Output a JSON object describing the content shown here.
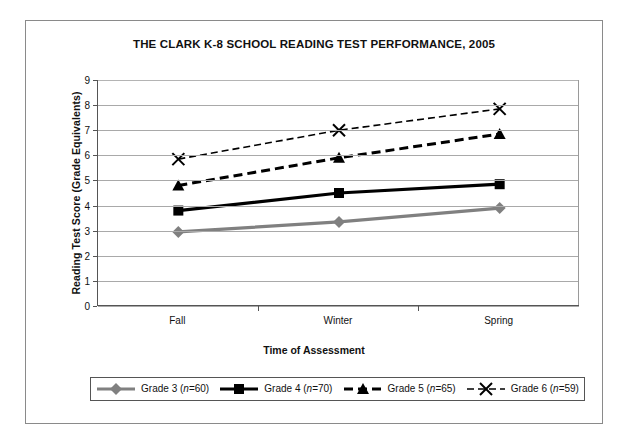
{
  "chart_data": {
    "type": "line",
    "title": "THE CLARK K-8 SCHOOL READING TEST PERFORMANCE, 2005",
    "xlabel": "Time of Assessment",
    "ylabel": "Reading Test Score (Grade Equivalents)",
    "categories": [
      "Fall",
      "Winter",
      "Spring"
    ],
    "ylim": [
      0,
      9
    ],
    "yticks": [
      0,
      1,
      2,
      3,
      4,
      5,
      6,
      7,
      8,
      9
    ],
    "ytick_labels": [
      "0",
      "1",
      "2",
      "3",
      "4",
      "5",
      "6",
      "7",
      "8",
      "9"
    ],
    "grid": true,
    "legend_position": "bottom",
    "series": [
      {
        "name": "Grade 3 (n=60)",
        "label_main": "Grade 3 (",
        "label_italic": "n",
        "label_tail": "=60)",
        "values": [
          2.95,
          3.35,
          3.9
        ],
        "color": "#808080",
        "linestyle": "solid",
        "marker": "diamond"
      },
      {
        "name": "Grade 4 (n=70)",
        "label_main": "Grade 4 (",
        "label_italic": "n",
        "label_tail": "=70)",
        "values": [
          3.8,
          4.5,
          4.85
        ],
        "color": "#000000",
        "linestyle": "solid",
        "marker": "square"
      },
      {
        "name": "Grade 5 (n=65)",
        "label_main": "Grade 5 (",
        "label_italic": "n",
        "label_tail": "=65)",
        "values": [
          4.8,
          5.9,
          6.85
        ],
        "color": "#000000",
        "linestyle": "dashed",
        "marker": "triangle"
      },
      {
        "name": "Grade 6 (n=59)",
        "label_main": "Grade 6 (",
        "label_italic": "n",
        "label_tail": "=59)",
        "values": [
          5.85,
          7.0,
          7.85
        ],
        "color": "#000000",
        "linestyle": "dotted-dash",
        "marker": "x-cross"
      }
    ]
  }
}
